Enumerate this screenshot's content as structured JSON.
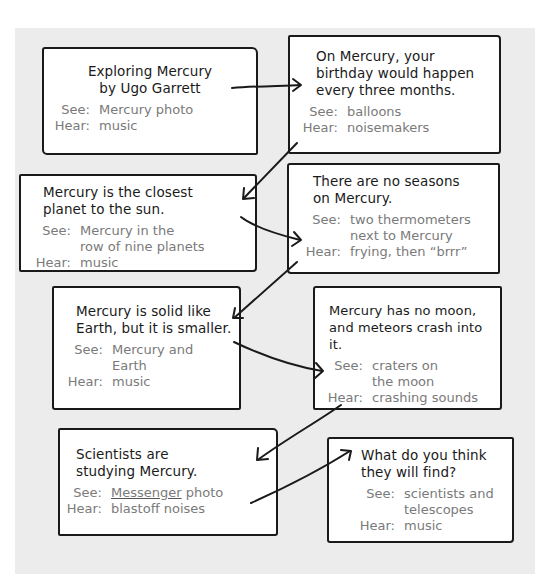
{
  "storyboard": {
    "cards": [
      {
        "title": "Exploring Mercury by Ugo Garrett",
        "title_lines": [
          "Exploring Mercury",
          "by Ugo Garrett"
        ],
        "see_label": "See:",
        "see": [
          "Mercury photo"
        ],
        "hear_label": "Hear:",
        "hear": "music"
      },
      {
        "title_lines": [
          "On Mercury, your",
          "birthday would happen",
          "every three months."
        ],
        "see_label": "See:",
        "see": [
          "balloons"
        ],
        "hear_label": "Hear:",
        "hear": "noisemakers"
      },
      {
        "title_lines": [
          "Mercury is the closest",
          "planet to the sun."
        ],
        "see_label": "See:",
        "see": [
          "Mercury in the",
          "row of nine planets"
        ],
        "hear_label": "Hear:",
        "hear": "music"
      },
      {
        "title_lines": [
          "There are no seasons",
          "on Mercury."
        ],
        "see_label": "See:",
        "see": [
          "two thermometers",
          "next to Mercury"
        ],
        "hear_label": "Hear:",
        "hear": "frying, then “brrr”"
      },
      {
        "title_lines": [
          "Mercury is solid like",
          "Earth, but it is smaller."
        ],
        "see_label": "See:",
        "see": [
          "Mercury and",
          "Earth"
        ],
        "hear_label": "Hear:",
        "hear": "music"
      },
      {
        "title_lines": [
          "Mercury has no moon,",
          "and meteors crash into it."
        ],
        "see_label": "See:",
        "see": [
          "craters on",
          "the moon"
        ],
        "hear_label": "Hear:",
        "hear": "crashing sounds"
      },
      {
        "title_lines": [
          "Scientists are",
          "studying Mercury."
        ],
        "see_label": "See:",
        "see_underlined": "Messenger",
        "see_rest": " photo",
        "hear_label": "Hear:",
        "hear": "blastoff noises"
      },
      {
        "title_lines": [
          "What do you think",
          "they will find?"
        ],
        "see_label": "See:",
        "see": [
          "scientists and",
          "telescopes"
        ],
        "hear_label": "Hear:",
        "hear": "music"
      }
    ],
    "colors": {
      "panel_bg": "#ececec",
      "card_bg": "#ffffff",
      "outline": "#1a1a1a",
      "label_text": "#7a7a7a"
    }
  }
}
